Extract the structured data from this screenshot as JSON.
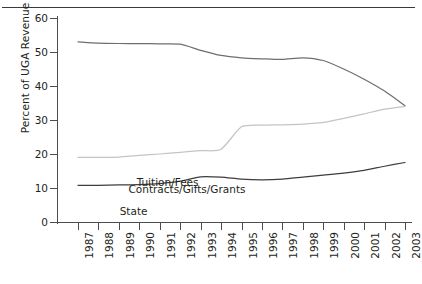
{
  "chart_data": {
    "type": "line",
    "title": "",
    "xlabel": "",
    "ylabel": "Percent of UGA Revenue",
    "ylim": [
      0,
      60
    ],
    "yticks": [
      0,
      10,
      20,
      30,
      40,
      50,
      60
    ],
    "grid": false,
    "legend_position": "inline-annotations",
    "categories": [
      "1987",
      "1988",
      "1989",
      "1990",
      "1991",
      "1992",
      "1993",
      "1994",
      "1995",
      "1996",
      "1997",
      "1998",
      "1999",
      "2000",
      "2001",
      "2002",
      "2003"
    ],
    "series": [
      {
        "name": "State",
        "color": "#6e6e6e",
        "values": [
          53.0,
          52.6,
          52.5,
          52.5,
          52.4,
          52.3,
          50.5,
          49.0,
          48.3,
          48.0,
          47.8,
          48.3,
          47.5,
          45.0,
          42.0,
          38.5,
          34.2
        ],
        "label": "State",
        "label_x": 2.04,
        "label_y": 3.08
      },
      {
        "name": "Contracts/Gifts/Grants",
        "color": "#c4c4c4",
        "values": [
          19.0,
          19.0,
          19.1,
          19.6,
          20.0,
          20.5,
          21.0,
          21.4,
          28.0,
          28.5,
          28.6,
          28.8,
          29.3,
          30.5,
          31.8,
          33.2,
          34.0
        ],
        "label": "Contracts/Gifts/Grants",
        "label_x": 2.47,
        "label_y": 9.33
      },
      {
        "name": "Tuition/Fees",
        "color": "#3d3d3d",
        "values": [
          10.8,
          10.8,
          10.9,
          11.0,
          11.3,
          12.0,
          13.3,
          13.2,
          12.6,
          12.4,
          12.6,
          13.2,
          13.8,
          14.4,
          15.2,
          16.4,
          17.5
        ],
        "label": "Tuition/Fees",
        "label_x": 2.87,
        "label_y": 11.57
      }
    ]
  },
  "axis": {
    "y_label_text": "Percent of UGA Revenue",
    "y_tick_labels": [
      "60",
      "50",
      "40",
      "30",
      "20",
      "10",
      "0"
    ],
    "x_tick_labels": [
      "1987",
      "1988",
      "1989",
      "1990",
      "1991",
      "1992",
      "1993",
      "1994",
      "1995",
      "1996",
      "1997",
      "1998",
      "1999",
      "2000",
      "2001",
      "2002",
      "2003"
    ]
  },
  "annotations": {
    "state": "State",
    "contracts": "Contracts/Gifts/Grants",
    "tuition": "Tuition/Fees"
  }
}
